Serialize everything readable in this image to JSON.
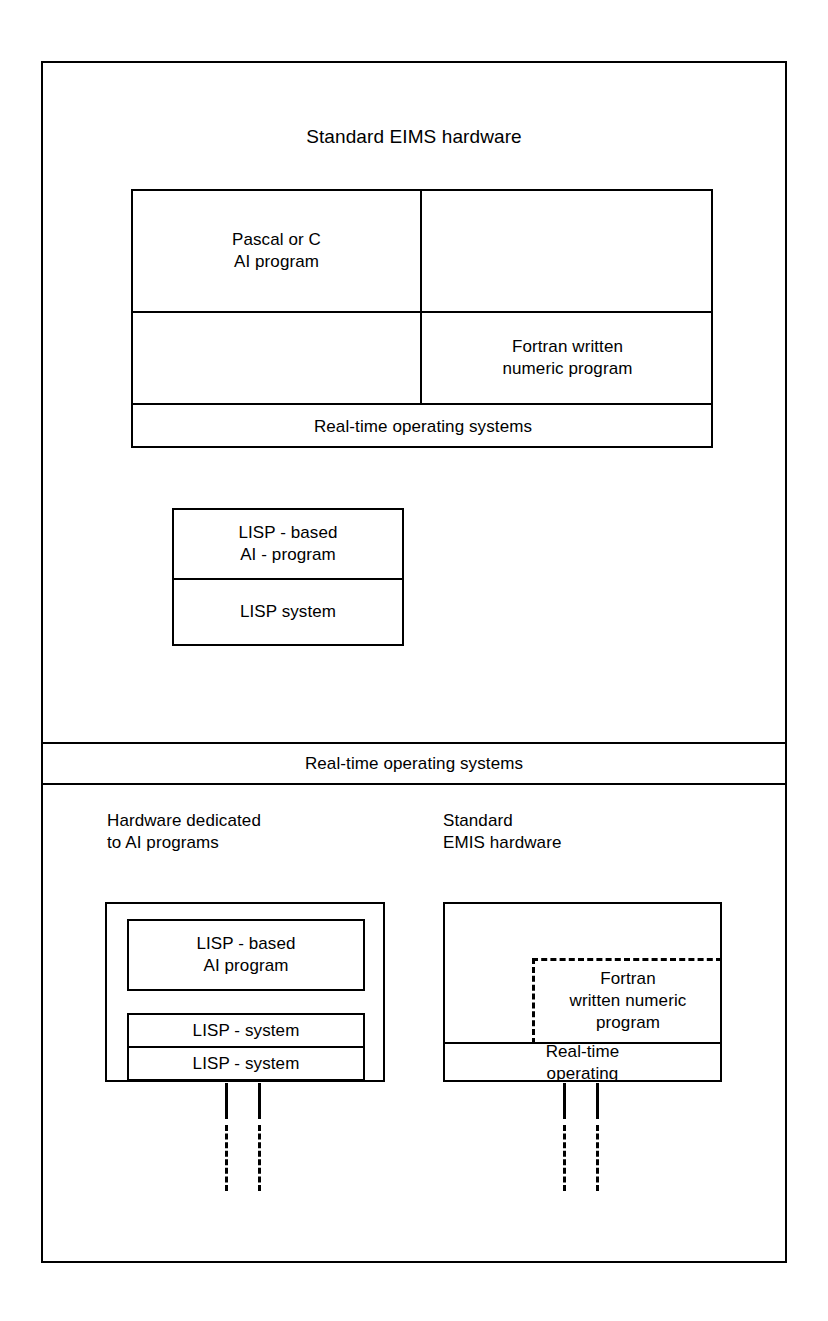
{
  "diagram": {
    "title": "Standard EIMS hardware",
    "upper_section": {
      "grid": {
        "cell_top_left": "Pascal or C\nAI program",
        "cell_top_right": "",
        "cell_mid_left": "",
        "cell_mid_right": "Fortran written\nnumeric program",
        "cell_bottom_full": "Real-time operating systems"
      },
      "lisp_stack": {
        "top": "LISP - based\nAI - program",
        "bottom": "LISP system"
      }
    },
    "middle_band": {
      "label": "Real-time operating systems"
    },
    "lower_section": {
      "left_caption": "Hardware dedicated\nto AI programs",
      "right_caption": "Standard\nEMIS hardware",
      "left_group": {
        "program_box": "LISP - based\nAI program",
        "system_box_1": "LISP - system",
        "system_box_2": "LISP - system"
      },
      "right_group": {
        "dashed_box": "Fortran\nwritten numeric\nprogram",
        "os_box": "Real-time\noperating"
      }
    }
  },
  "colors": {
    "line": "#000000",
    "background": "#ffffff",
    "text": "#000000"
  }
}
